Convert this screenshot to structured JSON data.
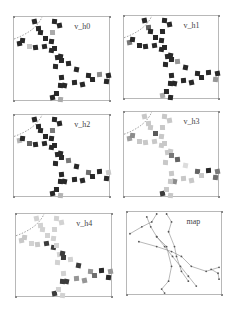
{
  "figure": {
    "panels": [
      {
        "title": "v_h0",
        "x": 13,
        "y": 16,
        "w": 97,
        "h": 85
      },
      {
        "title": "v_h1",
        "x": 123,
        "y": 15,
        "w": 96,
        "h": 84
      },
      {
        "title": "v_h2",
        "x": 13,
        "y": 114,
        "w": 97,
        "h": 83
      },
      {
        "title": "v_h3",
        "x": 123,
        "y": 111,
        "w": 96,
        "h": 86
      },
      {
        "title": "v_h4",
        "x": 15,
        "y": 213,
        "w": 97,
        "h": 84
      },
      {
        "title": "map",
        "x": 126,
        "y": 211,
        "w": 96,
        "h": 84
      }
    ],
    "square_positions": [
      [
        18,
        2
      ],
      [
        38,
        2
      ],
      [
        22,
        9
      ],
      [
        43,
        6
      ],
      [
        24,
        13
      ],
      [
        36,
        13
      ],
      [
        3,
        24
      ],
      [
        6,
        21
      ],
      [
        13,
        27
      ],
      [
        28,
        27
      ],
      [
        35,
        22
      ],
      [
        29,
        19
      ],
      [
        19,
        28
      ],
      [
        35,
        31
      ],
      [
        38,
        29
      ],
      [
        41,
        38
      ],
      [
        44,
        37
      ],
      [
        45,
        41
      ],
      [
        52,
        44
      ],
      [
        60,
        50
      ],
      [
        39,
        47
      ],
      [
        45,
        58
      ],
      [
        48,
        66
      ],
      [
        44,
        66
      ],
      [
        58,
        63
      ],
      [
        66,
        65
      ],
      [
        72,
        56
      ],
      [
        83,
        55
      ],
      [
        92,
        56
      ],
      [
        90,
        62
      ],
      [
        76,
        60
      ],
      [
        36,
        78
      ],
      [
        44,
        80
      ],
      [
        40,
        74
      ]
    ],
    "gray_levels": {
      "v_h0": [
        40,
        40,
        40,
        40,
        40,
        170,
        40,
        40,
        200,
        40,
        40,
        40,
        40,
        40,
        40,
        40,
        40,
        40,
        40,
        40,
        40,
        40,
        40,
        40,
        40,
        40,
        40,
        140,
        40,
        40,
        40,
        40,
        170,
        40
      ],
      "v_h1": [
        40,
        40,
        100,
        40,
        40,
        40,
        120,
        40,
        40,
        40,
        40,
        40,
        40,
        40,
        40,
        40,
        40,
        40,
        150,
        40,
        40,
        40,
        40,
        40,
        40,
        40,
        40,
        40,
        40,
        150,
        40,
        170,
        40,
        40
      ],
      "v_h2": [
        40,
        40,
        40,
        40,
        40,
        120,
        180,
        40,
        100,
        40,
        40,
        40,
        40,
        40,
        40,
        40,
        40,
        40,
        120,
        40,
        40,
        40,
        40,
        40,
        40,
        40,
        110,
        40,
        200,
        40,
        40,
        40,
        180,
        40
      ],
      "v_h3": [
        200,
        200,
        200,
        200,
        200,
        200,
        160,
        140,
        200,
        200,
        200,
        90,
        200,
        200,
        200,
        200,
        200,
        120,
        100,
        220,
        200,
        200,
        140,
        200,
        200,
        200,
        100,
        40,
        120,
        110,
        200,
        60,
        200,
        200
      ],
      "v_h4": [
        210,
        210,
        210,
        210,
        210,
        210,
        200,
        200,
        210,
        60,
        210,
        210,
        200,
        60,
        210,
        210,
        60,
        60,
        210,
        60,
        210,
        210,
        60,
        60,
        150,
        150,
        150,
        40,
        150,
        40,
        110,
        60,
        210,
        210
      ]
    },
    "map": {
      "lines": [
        [
          [
            20,
            5
          ],
          [
            24,
            15
          ],
          [
            30,
            25
          ],
          [
            38,
            35
          ],
          [
            46,
            45
          ],
          [
            54,
            55
          ],
          [
            62,
            65
          ],
          [
            70,
            75
          ]
        ],
        [
          [
            3,
            22
          ],
          [
            15,
            15
          ],
          [
            25,
            10
          ],
          [
            30,
            2
          ]
        ],
        [
          [
            12,
            30
          ],
          [
            30,
            35
          ],
          [
            45,
            40
          ],
          [
            55,
            45
          ],
          [
            65,
            55
          ],
          [
            80,
            60
          ],
          [
            93,
            56
          ]
        ],
        [
          [
            40,
            2
          ],
          [
            45,
            10
          ],
          [
            42,
            20
          ],
          [
            48,
            35
          ],
          [
            50,
            45
          ],
          [
            55,
            60
          ],
          [
            62,
            70
          ]
        ],
        [
          [
            30,
            25
          ],
          [
            40,
            35
          ],
          [
            45,
            55
          ],
          [
            42,
            70
          ],
          [
            35,
            78
          ],
          [
            38,
            82
          ]
        ],
        [
          [
            85,
            58
          ],
          [
            92,
            62
          ],
          [
            93,
            68
          ]
        ]
      ]
    },
    "colors": {
      "frame": "#b8b8b8",
      "arc": "#555555",
      "map_line": "#888888",
      "map_node": "#555555"
    }
  }
}
